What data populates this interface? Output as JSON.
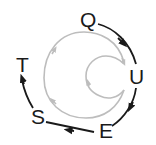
{
  "diagram": {
    "nodes": [
      {
        "id": "Q",
        "label": "Q"
      },
      {
        "id": "U",
        "label": "U"
      },
      {
        "id": "E",
        "label": "E"
      },
      {
        "id": "S",
        "label": "S"
      },
      {
        "id": "T",
        "label": "T"
      }
    ],
    "edges": [
      {
        "from": "Q",
        "to": "U"
      },
      {
        "from": "U",
        "to": "E"
      },
      {
        "from": "E",
        "to": "S"
      },
      {
        "from": "S",
        "to": "T"
      }
    ],
    "colors": {
      "outer_path": "#1a1a1a",
      "inner_spiral": "#bdbdbd",
      "text": "#1a1a1a"
    }
  }
}
